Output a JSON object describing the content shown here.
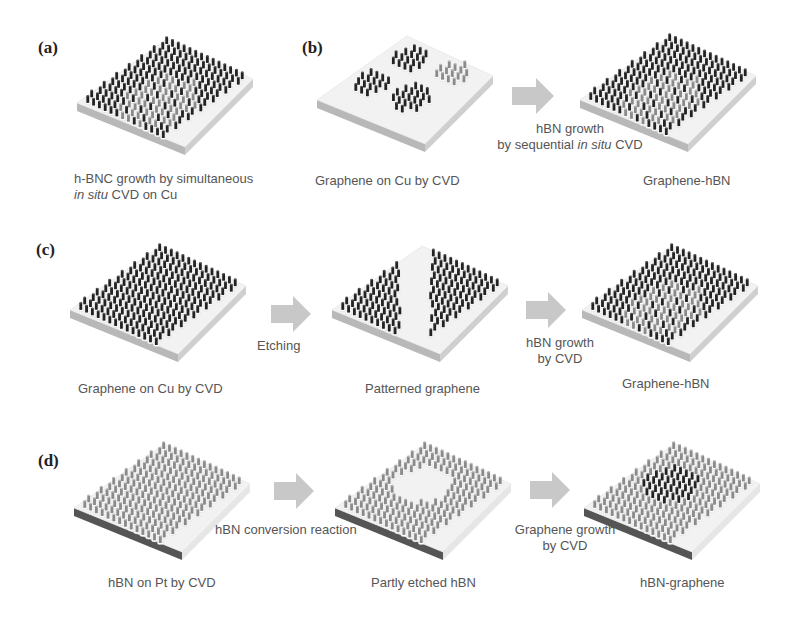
{
  "figure": {
    "panels": [
      {
        "id": "a",
        "label": "(a)",
        "substrates": [
          {
            "name": "hbnc-substrate",
            "pattern": "mixed",
            "caption_line1": "h-BNC growth by simultaneous",
            "caption_line2_italic": "in situ",
            "caption_line2_rest": " CVD on Cu"
          }
        ]
      },
      {
        "id": "b",
        "label": "(b)",
        "substrates": [
          {
            "name": "graphene-islands-substrate",
            "pattern": "islands",
            "caption": "Graphene on Cu by CVD"
          },
          {
            "name": "graphene-hbn-substrate",
            "pattern": "mixed",
            "caption": "Graphene-hBN"
          }
        ],
        "arrows": [
          {
            "line1": "hBN growth",
            "line2_prefix": "by sequential ",
            "line2_italic": "in situ",
            "line2_suffix": " CVD"
          }
        ]
      },
      {
        "id": "c",
        "label": "(c)",
        "substrates": [
          {
            "name": "graphene-on-cu-substrate",
            "pattern": "full-dark",
            "caption": "Graphene on Cu by CVD"
          },
          {
            "name": "patterned-graphene-substrate",
            "pattern": "stripe-etched",
            "caption": "Patterned graphene"
          },
          {
            "name": "graphene-hbn-substrate",
            "pattern": "mixed",
            "caption": "Graphene-hBN"
          }
        ],
        "arrows": [
          {
            "line1": "Etching"
          },
          {
            "line1": "hBN growth",
            "line2": "by CVD"
          }
        ]
      },
      {
        "id": "d",
        "label": "(d)",
        "substrates": [
          {
            "name": "hbn-on-pt-substrate",
            "pattern": "full-light",
            "caption": "hBN on Pt by CVD"
          },
          {
            "name": "partly-etched-hbn-substrate",
            "pattern": "hole-etched",
            "caption": "Partly etched hBN"
          },
          {
            "name": "hbn-graphene-substrate",
            "pattern": "hole-filled",
            "caption": "hBN-graphene"
          }
        ],
        "arrows": [
          {
            "line1": "hBN conversion reaction"
          },
          {
            "line1": "Graphene growth",
            "line2": "by CVD"
          }
        ]
      }
    ],
    "colors": {
      "arrow_fill": "#c8c8c8",
      "slab_top": "#f2f2f2",
      "slab_side_light": "#b8b8b8",
      "slab_side_dark": "#555555",
      "pillar_dark": "#222222",
      "pillar_light": "#8a8a8a",
      "text": "#555555"
    }
  }
}
